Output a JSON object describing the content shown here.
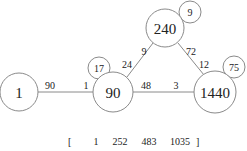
{
  "nodes": {
    "n1": {
      "label": "1"
    },
    "n90": {
      "label": "90"
    },
    "n240": {
      "label": "240"
    },
    "n1440": {
      "label": "1440"
    }
  },
  "self_loops": {
    "s17": {
      "label": "17"
    },
    "s9": {
      "label": "9"
    },
    "s75": {
      "label": "75"
    }
  },
  "edges": {
    "e1_90": {
      "label_near_1": "90",
      "label_near_90": "1"
    },
    "e90_240": {
      "label_near_90": "24",
      "label_near_240": "9"
    },
    "e240_1440": {
      "label_near_240": "72",
      "label_near_1440": "12"
    },
    "e90_1440": {
      "label_near_90": "48",
      "label_near_1440": "3"
    }
  },
  "vector": {
    "open_bracket": "[",
    "values": [
      "1",
      "252",
      "483",
      "1035"
    ],
    "close_bracket": "]"
  }
}
